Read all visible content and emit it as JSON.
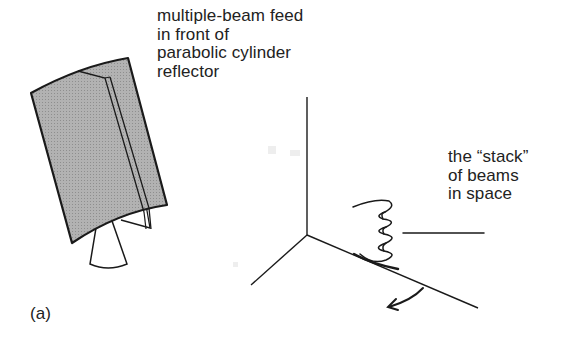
{
  "figure": {
    "panel_label": "(a)",
    "feed_label": "multiple-beam feed\nin front of\nparabolic cylinder\nreflector",
    "stack_label": "the “stack”\nof beams\nin space",
    "colors": {
      "reflector_fill": "#a9a9a9",
      "line": "#1a1a1a",
      "background": "#ffffff"
    }
  }
}
